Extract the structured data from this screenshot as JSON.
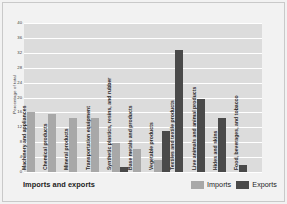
{
  "chart_data": {
    "type": "bar",
    "title": "",
    "xlabel": "Imports and exports",
    "ylabel": "Percentage of total",
    "ylim": [
      0,
      40
    ],
    "ytick_step": 4,
    "yticks": [
      "40",
      "36",
      "32",
      "28",
      "24",
      "20",
      "16",
      "12",
      "8",
      "4",
      "0"
    ],
    "grid": true,
    "legend_position": "bottom-right",
    "categories": [
      "Machinery and appliances",
      "Chemical products",
      "Mineral products",
      "Transportation equipment",
      "Synthetic plastics, resins, and rubber",
      "Base metals and products",
      "Vegetable products",
      "Textiles and textile products",
      "Live animals and animal products",
      "Hides and skins",
      "Food, beverages, and tobacco"
    ],
    "series": [
      {
        "name": "Imports",
        "color": "#a8a8a8",
        "values": [
          16.2,
          15.5,
          14.6,
          14.6,
          7.9,
          6.2,
          3.2,
          null,
          null,
          null,
          null
        ]
      },
      {
        "name": "Exports",
        "color": "#4a4a4a",
        "values": [
          null,
          null,
          null,
          null,
          1.4,
          null,
          11.0,
          32.8,
          19.5,
          14.4,
          1.8
        ]
      }
    ]
  },
  "legend": {
    "items": [
      {
        "label": "Imports",
        "swatch": "imports-swatch"
      },
      {
        "label": "Exports",
        "swatch": "exports-swatch"
      }
    ]
  }
}
